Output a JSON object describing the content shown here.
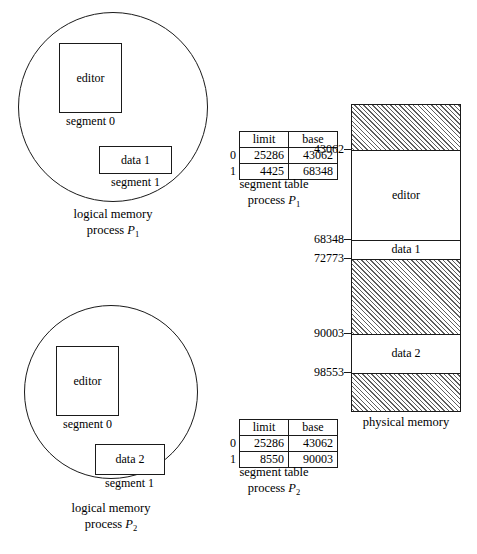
{
  "figure": {
    "logical_memories": [
      {
        "id": "p1",
        "segments": [
          {
            "name": "editor",
            "caption": "segment 0"
          },
          {
            "name": "data 1",
            "caption": "segment 1"
          }
        ],
        "caption_line1": "logical memory",
        "caption_line2_prefix": "process ",
        "caption_line2_symbol": "P",
        "caption_line2_subscript": "1"
      },
      {
        "id": "p2",
        "segments": [
          {
            "name": "editor",
            "caption": "segment 0"
          },
          {
            "name": "data 2",
            "caption": "segment 1"
          }
        ],
        "caption_line1": "logical memory",
        "caption_line2_prefix": "process ",
        "caption_line2_symbol": "P",
        "caption_line2_subscript": "2"
      }
    ],
    "segment_tables": [
      {
        "id": "p1",
        "headers": [
          "limit",
          "base"
        ],
        "rows": [
          {
            "index": "0",
            "limit": "25286",
            "base": "43062"
          },
          {
            "index": "1",
            "limit": "4425",
            "base": "68348"
          }
        ],
        "caption_line1": "segment table",
        "caption_line2_prefix": "process ",
        "caption_line2_symbol": "P",
        "caption_line2_subscript": "1"
      },
      {
        "id": "p2",
        "headers": [
          "limit",
          "base"
        ],
        "rows": [
          {
            "index": "0",
            "limit": "25286",
            "base": "43062"
          },
          {
            "index": "1",
            "limit": "8550",
            "base": "90003"
          }
        ],
        "caption_line1": "segment table",
        "caption_line2_prefix": "process ",
        "caption_line2_symbol": "P",
        "caption_line2_subscript": "2"
      }
    ],
    "physical_memory": {
      "caption": "physical memory",
      "bands": [
        {
          "label": "",
          "hatched": true
        },
        {
          "label": "editor",
          "hatched": false
        },
        {
          "label": "data 1",
          "hatched": false
        },
        {
          "label": "",
          "hatched": true
        },
        {
          "label": "data 2",
          "hatched": false
        },
        {
          "label": "",
          "hatched": true
        }
      ],
      "addresses": [
        "43062",
        "68348",
        "72773",
        "90003",
        "98553"
      ]
    }
  }
}
